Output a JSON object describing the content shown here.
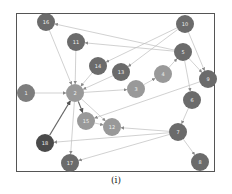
{
  "caption": "(i)",
  "colors": {
    "node_dark": "#6b6b6b",
    "node_mid": "#7d7d7d",
    "node_light": "#999999",
    "node_darkest": "#4a4a4a",
    "edge": "#bdbdbd",
    "edge_strong": "#666666",
    "label": "#f0f0f0"
  },
  "nodes": [
    {
      "id": "16",
      "x": 46,
      "y": 22,
      "shade": "node_dark"
    },
    {
      "id": "11",
      "x": 76,
      "y": 42,
      "shade": "node_dark"
    },
    {
      "id": "10",
      "x": 185,
      "y": 24,
      "shade": "node_dark"
    },
    {
      "id": "5",
      "x": 183,
      "y": 52,
      "shade": "node_dark"
    },
    {
      "id": "14",
      "x": 98,
      "y": 66,
      "shade": "node_dark"
    },
    {
      "id": "13",
      "x": 121,
      "y": 72,
      "shade": "node_dark"
    },
    {
      "id": "4",
      "x": 163,
      "y": 74,
      "shade": "node_light"
    },
    {
      "id": "9",
      "x": 208,
      "y": 79,
      "shade": "node_dark"
    },
    {
      "id": "1",
      "x": 26,
      "y": 93,
      "shade": "node_mid"
    },
    {
      "id": "2",
      "x": 75,
      "y": 93,
      "shade": "node_light"
    },
    {
      "id": "3",
      "x": 136,
      "y": 89,
      "shade": "node_light"
    },
    {
      "id": "6",
      "x": 192,
      "y": 100,
      "shade": "node_dark"
    },
    {
      "id": "15",
      "x": 86,
      "y": 121,
      "shade": "node_light"
    },
    {
      "id": "12",
      "x": 112,
      "y": 127,
      "shade": "node_light"
    },
    {
      "id": "18",
      "x": 45,
      "y": 143,
      "shade": "node_darkest"
    },
    {
      "id": "7",
      "x": 178,
      "y": 132,
      "shade": "node_dark"
    },
    {
      "id": "17",
      "x": 70,
      "y": 163,
      "shade": "node_dark"
    },
    {
      "id": "8",
      "x": 200,
      "y": 162,
      "shade": "node_dark"
    }
  ],
  "edges": [
    {
      "from": "16",
      "to": "2"
    },
    {
      "from": "5",
      "to": "16"
    },
    {
      "from": "11",
      "to": "2"
    },
    {
      "from": "5",
      "to": "11"
    },
    {
      "from": "10",
      "to": "14"
    },
    {
      "from": "10",
      "to": "9"
    },
    {
      "from": "10",
      "to": "13"
    },
    {
      "from": "5",
      "to": "9"
    },
    {
      "from": "5",
      "to": "6"
    },
    {
      "from": "14",
      "to": "2"
    },
    {
      "from": "13",
      "to": "2"
    },
    {
      "from": "1",
      "to": "2"
    },
    {
      "from": "2",
      "to": "3"
    },
    {
      "from": "3",
      "to": "4"
    },
    {
      "from": "4",
      "to": "5"
    },
    {
      "from": "9",
      "to": "15"
    },
    {
      "from": "2",
      "to": "15",
      "strong": true
    },
    {
      "from": "2",
      "to": "12"
    },
    {
      "from": "15",
      "to": "12"
    },
    {
      "from": "18",
      "to": "2",
      "strong": true
    },
    {
      "from": "2",
      "to": "17"
    },
    {
      "from": "7",
      "to": "18"
    },
    {
      "from": "7",
      "to": "17"
    },
    {
      "from": "7",
      "to": "12"
    },
    {
      "from": "6",
      "to": "7"
    },
    {
      "from": "7",
      "to": "8"
    }
  ]
}
